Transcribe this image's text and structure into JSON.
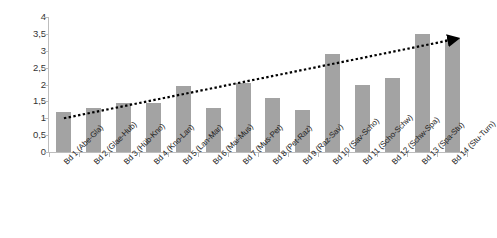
{
  "chart_data": {
    "type": "bar",
    "title": "",
    "xlabel": "",
    "ylabel": "",
    "ylim": [
      0,
      4
    ],
    "grid": false,
    "legend": "none",
    "decimal_separator": ",",
    "y_ticks": [
      "0",
      "0,5",
      "1",
      "1,5",
      "2",
      "2,5",
      "3",
      "3,5",
      "4"
    ],
    "y_tick_values": [
      0,
      0.5,
      1,
      1.5,
      2,
      2.5,
      3,
      3.5,
      4
    ],
    "categories": [
      "Bd 1 (Abe-Gla)",
      "Bd 2 (Glae-Hub)",
      "Bd 3 (Hüb-Kno)",
      "Bd 4 (Kno-Lan)",
      "Bd 5 (Lan-Mar)",
      "Bd 6 (Mai-Mus)",
      "Bd 7 (Mus-Pet)",
      "Bd 8 (Pet-Raz)",
      "Bd 9 (Raz-Sav)",
      "Bd 10 (Sav-Scho)",
      "Bd 11 (Scho-Schw)",
      "Bd 12 (Schw-Spa)",
      "Bd 13 (Spa-Stu)",
      "Bd 14 (Stu-Turn)"
    ],
    "values": [
      1.2,
      1.3,
      1.45,
      1.45,
      1.95,
      1.3,
      2.05,
      1.6,
      1.25,
      2.9,
      2.0,
      2.2,
      3.5,
      3.35
    ],
    "series": [
      {
        "name": "Bände",
        "values": [
          1.2,
          1.3,
          1.45,
          1.45,
          1.95,
          1.3,
          2.05,
          1.6,
          1.25,
          2.9,
          2.0,
          2.2,
          3.5,
          3.35
        ],
        "color": "#a3a3a3"
      }
    ],
    "trendline": {
      "type": "dotted-arrow",
      "color": "#000000",
      "start_value": 1.0,
      "end_value": 3.35,
      "has_arrowhead": true
    }
  }
}
